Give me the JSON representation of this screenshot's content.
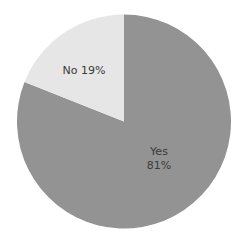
{
  "chart_data": {
    "type": "pie",
    "title": "",
    "categories": [
      "Yes",
      "No"
    ],
    "values": [
      81,
      19
    ],
    "labels": [
      "Yes\n81%",
      "No 19%"
    ],
    "colors": [
      "#939393",
      "#e6e6e6"
    ],
    "start_angle": "12 o'clock",
    "direction": "No slice counter-clockwise from top; Yes fills remainder",
    "legend": "none (labels drawn inside slices)"
  },
  "labels": {
    "no": "No 19%",
    "yes_name": "Yes",
    "yes_pct": "81%"
  }
}
